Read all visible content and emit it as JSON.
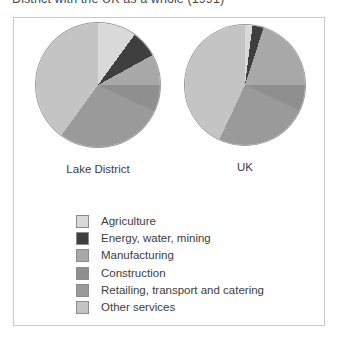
{
  "title": "District with the UK as a whole (1991)",
  "figure": {
    "lake_label": "Lake District",
    "uk_label": "UK"
  },
  "legend": {
    "items": [
      {
        "label": "Agriculture",
        "color": "#d9d9d9"
      },
      {
        "label": "Energy, water, mining",
        "color": "#3f3f3f"
      },
      {
        "label": "Manufacturing",
        "color": "#a8a8a8"
      },
      {
        "label": "Construction",
        "color": "#8f8f8f"
      },
      {
        "label": "Retailing, transport and catering",
        "color": "#9a9a9a"
      },
      {
        "label": "Other services",
        "color": "#c4c4c4"
      }
    ]
  },
  "chart_data": {
    "type": "pie",
    "title": "District with the UK as a whole (1991)",
    "categories": [
      "Agriculture",
      "Energy, water, mining",
      "Manufacturing",
      "Construction",
      "Retailing, transport and catering",
      "Other services"
    ],
    "colors": [
      "#d9d9d9",
      "#3f3f3f",
      "#a8a8a8",
      "#8f8f8f",
      "#9a9a9a",
      "#c4c4c4"
    ],
    "unit": "percent of employment",
    "legend_position": "bottom",
    "start_angle_deg": 0,
    "direction": "clockwise",
    "series": [
      {
        "name": "Lake District",
        "values": [
          10,
          7,
          8,
          7,
          28,
          40
        ]
      },
      {
        "name": "UK",
        "values": [
          2,
          3,
          20,
          7,
          25,
          43
        ]
      }
    ]
  }
}
